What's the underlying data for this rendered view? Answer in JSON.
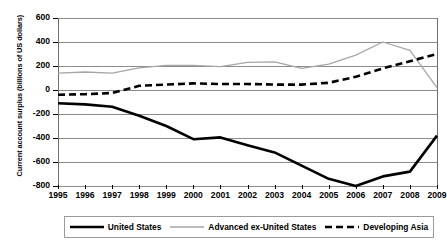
{
  "chart_data": {
    "type": "line",
    "title": "",
    "xlabel": "",
    "ylabel": "Current account surplus (billions of US dollars)",
    "x": [
      1995,
      1996,
      1997,
      1998,
      1999,
      2000,
      2001,
      2002,
      2003,
      2004,
      2005,
      2006,
      2007,
      2008,
      2009
    ],
    "categories": [
      "1995",
      "1996",
      "1997",
      "1998",
      "1999",
      "2000",
      "2001",
      "2002",
      "2003",
      "2004",
      "2005",
      "2006",
      "2007",
      "2008",
      "2009"
    ],
    "ylim": [
      -800,
      600
    ],
    "yticks": [
      -800,
      -600,
      -400,
      -200,
      0,
      200,
      400,
      600
    ],
    "ytick_labels": [
      "-800",
      "-600",
      "-400",
      "-200",
      "0",
      "200",
      "400",
      "600"
    ],
    "grid": true,
    "legend_position": "bottom",
    "series": [
      {
        "name": "United States",
        "style": "solid-thick",
        "color": "#000000",
        "values": [
          -110,
          -120,
          -140,
          -215,
          -300,
          -410,
          -395,
          -460,
          -520,
          -630,
          -740,
          -800,
          -720,
          -680,
          -380
        ]
      },
      {
        "name": "Advanced ex-United States",
        "style": "solid-thin",
        "color": "#a6a6a6",
        "values": [
          140,
          150,
          140,
          185,
          205,
          205,
          195,
          230,
          235,
          180,
          215,
          290,
          400,
          330,
          20
        ]
      },
      {
        "name": "Developing Asia",
        "style": "dashed",
        "color": "#000000",
        "values": [
          -40,
          -35,
          -25,
          35,
          45,
          55,
          50,
          50,
          45,
          45,
          60,
          110,
          180,
          240,
          300
        ]
      }
    ]
  },
  "legend": {
    "entries": [
      {
        "label": "United States"
      },
      {
        "label": "Advanced ex-United States"
      },
      {
        "label": "Developing Asia"
      }
    ]
  }
}
